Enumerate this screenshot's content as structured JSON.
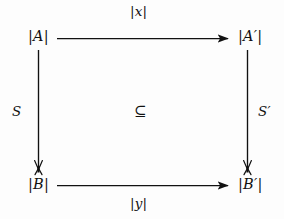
{
  "figure": {
    "type": "commutative-diagram",
    "shape": "square",
    "background_color": "#fdfdfd",
    "stroke_color": "#111111"
  },
  "nodes": {
    "top_left": "|A|",
    "top_right": "|A′|",
    "bottom_left": "|B|",
    "bottom_right": "|B′|"
  },
  "edges": {
    "top": {
      "label": "|x|",
      "from": "top_left",
      "to": "top_right",
      "direction": "right",
      "arrowhead": "filled-triangle"
    },
    "bottom": {
      "label": "|y|",
      "from": "bottom_left",
      "to": "bottom_right",
      "direction": "right",
      "arrowhead": "filled-triangle"
    },
    "left": {
      "label": "S",
      "from": "top_left",
      "to": "bottom_left",
      "direction": "down",
      "arrowhead": "narrow-hook"
    },
    "right": {
      "label": "S′",
      "from": "top_right",
      "to": "bottom_right",
      "direction": "down",
      "arrowhead": "narrow-hook"
    }
  },
  "center": {
    "relation_symbol": "⊆",
    "relation_name": "subset-or-equal"
  }
}
